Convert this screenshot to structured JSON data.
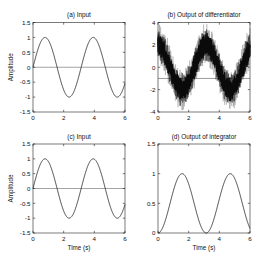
{
  "figure": {
    "background": "#ffffff",
    "axes_color": "#222222",
    "text_color": "#111111"
  },
  "chart_data": [
    {
      "id": "a",
      "type": "line",
      "title": "(a) Input",
      "xlabel": "",
      "ylabel": "Amplitude",
      "xlim": [
        0,
        6
      ],
      "ylim": [
        -1.5,
        1.5
      ],
      "xticks": [
        0,
        2,
        4,
        6
      ],
      "xtick_labels": [
        "0",
        "2",
        "4",
        "6"
      ],
      "yticks": [
        -1.5,
        -1,
        -0.5,
        0,
        0.5,
        1,
        1.5
      ],
      "ytick_labels": [
        "-1.5",
        "-1",
        "-0.5",
        "0",
        "0.5",
        "1",
        "1.5"
      ],
      "grid": false,
      "legend": null,
      "ref_lines": [
        {
          "y": 0,
          "color": "#333333",
          "opacity": 0.9
        }
      ],
      "series": [
        {
          "name": "input signal sin(2t)",
          "fn": "sin",
          "amp": 1,
          "omega": 2,
          "phase": 0,
          "offset": 0,
          "noise": 0,
          "samples": 500,
          "seed": 1,
          "color": "#1a1a1a",
          "width": 0.8,
          "opacity": 1
        }
      ],
      "sample_x": [
        0,
        0.5,
        1,
        1.5,
        2,
        2.5,
        3,
        3.5,
        4,
        4.5,
        5,
        5.5,
        6
      ],
      "sample_y": [
        0,
        0.841,
        0.909,
        0.141,
        -0.757,
        -0.959,
        -0.279,
        0.657,
        0.989,
        0.412,
        -0.544,
        -1.0,
        -0.537
      ]
    },
    {
      "id": "b",
      "type": "line",
      "title": "(b) Output of differentiator",
      "xlabel": "",
      "ylabel": "",
      "xlim": [
        0,
        6
      ],
      "ylim": [
        -4,
        4
      ],
      "xticks": [
        0,
        2,
        4,
        6
      ],
      "xtick_labels": [
        "0",
        "2",
        "4",
        "6"
      ],
      "yticks": [
        -4,
        -2,
        0,
        2,
        4
      ],
      "ytick_labels": [
        "-4",
        "-2",
        "0",
        "2",
        "4"
      ],
      "grid": false,
      "legend": null,
      "ref_lines": [
        {
          "y": -1,
          "color": "#141414",
          "opacity": 0.85
        }
      ],
      "series": [
        {
          "name": "noise band outer 2cos(2t)±2.0",
          "fn": "cos",
          "amp": 2,
          "omega": 2,
          "phase": 0,
          "offset": 0,
          "noise": 2.0,
          "samples": 1600,
          "seed": 11,
          "color": "#a3a3a3",
          "width": 0.9,
          "opacity": 0.55
        },
        {
          "name": "noise band mid 2cos(2t)±1.55",
          "fn": "cos",
          "amp": 2,
          "omega": 2,
          "phase": 0,
          "offset": 0,
          "noise": 1.55,
          "samples": 1600,
          "seed": 733,
          "color": "#4d4d4d",
          "width": 0.9,
          "opacity": 0.8
        },
        {
          "name": "noisy core 2cos(2t)±1.1",
          "fn": "cos",
          "amp": 2,
          "omega": 2,
          "phase": 0,
          "offset": 0,
          "noise": 1.1,
          "samples": 1600,
          "seed": 98765,
          "color": "#0b0b0b",
          "width": 0.9,
          "opacity": 0.95
        }
      ],
      "sample_x": [
        0,
        0.5,
        1,
        1.5,
        2,
        2.5,
        3,
        3.5,
        4,
        4.5,
        5,
        5.5,
        6
      ],
      "sample_y": [
        2,
        1.081,
        -0.832,
        -1.98,
        -1.307,
        0.567,
        1.921,
        1.508,
        -0.291,
        -1.822,
        -1.678,
        0.009,
        1.687
      ]
    },
    {
      "id": "c",
      "type": "line",
      "title": "(c) Input",
      "xlabel": "Time (s)",
      "ylabel": "Amplitude",
      "xlim": [
        0,
        6
      ],
      "ylim": [
        -1.5,
        1.5
      ],
      "xticks": [
        0,
        2,
        4,
        6
      ],
      "xtick_labels": [
        "0",
        "2",
        "4",
        "6"
      ],
      "yticks": [
        -1.5,
        -1,
        -0.5,
        0,
        0.5,
        1,
        1.5
      ],
      "ytick_labels": [
        "-1.5",
        "-1",
        "-0.5",
        "0",
        "0.5",
        "1",
        "1.5"
      ],
      "grid": false,
      "legend": null,
      "ref_lines": [
        {
          "y": 0,
          "color": "#333333",
          "opacity": 0.9
        }
      ],
      "series": [
        {
          "name": "input signal sin(2t)",
          "fn": "sin",
          "amp": 1,
          "omega": 2,
          "phase": 0,
          "offset": 0,
          "noise": 0,
          "samples": 500,
          "seed": 1,
          "color": "#1a1a1a",
          "width": 0.8,
          "opacity": 1
        }
      ],
      "sample_x": [
        0,
        0.5,
        1,
        1.5,
        2,
        2.5,
        3,
        3.5,
        4,
        4.5,
        5,
        5.5,
        6
      ],
      "sample_y": [
        0,
        0.841,
        0.909,
        0.141,
        -0.757,
        -0.959,
        -0.279,
        0.657,
        0.989,
        0.412,
        -0.544,
        -1.0,
        -0.537
      ]
    },
    {
      "id": "d",
      "type": "line",
      "title": "(d) Output of integrator",
      "xlabel": "Time (s)",
      "ylabel": "",
      "xlim": [
        0,
        6
      ],
      "ylim": [
        0,
        1.5
      ],
      "xticks": [
        0,
        2,
        4,
        6
      ],
      "xtick_labels": [
        "0",
        "2",
        "4",
        "6"
      ],
      "yticks": [
        0,
        0.5,
        1,
        1.5
      ],
      "ytick_labels": [
        "0",
        "0.5",
        "1",
        "1.5"
      ],
      "grid": false,
      "legend": null,
      "ref_lines": [],
      "series": [
        {
          "name": "integrator output (1-cos(2t))/2",
          "fn": "cos",
          "amp": -0.5,
          "omega": 2,
          "phase": 0,
          "offset": 0.5,
          "noise": 0,
          "samples": 500,
          "seed": 1,
          "color": "#1a1a1a",
          "width": 0.8,
          "opacity": 1
        }
      ],
      "sample_x": [
        0,
        0.5,
        1,
        1.5,
        2,
        2.5,
        3,
        3.5,
        4,
        4.5,
        5,
        5.5,
        6
      ],
      "sample_y": [
        0,
        0.23,
        0.708,
        0.995,
        0.827,
        0.358,
        0.02,
        0.123,
        0.573,
        0.956,
        0.92,
        0.498,
        0.078
      ]
    }
  ]
}
